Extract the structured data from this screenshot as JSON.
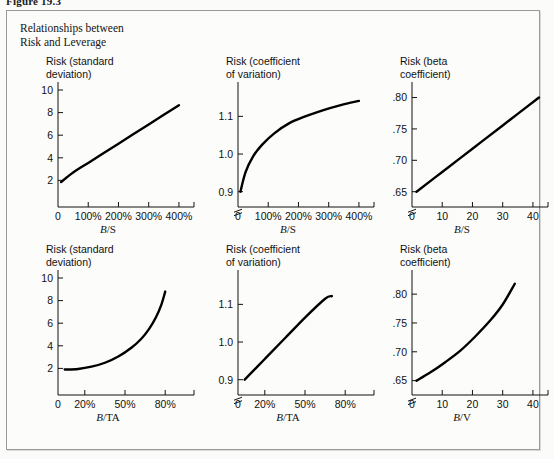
{
  "figure": {
    "number": "Figure 19.3",
    "caption_line1": "Relationships between",
    "caption_line2": "Risk and Leverage"
  },
  "chart_data": [
    {
      "id": "panel-1",
      "type": "line",
      "title": "Risk (standard\ndeviation)",
      "xlabel_num": "B",
      "xlabel_den": "/S",
      "xlabel": "B/S",
      "ylabel": "",
      "xticks": [
        "0",
        "100%",
        "200%",
        "300%",
        "400%"
      ],
      "xtick_values": [
        0,
        100,
        200,
        300,
        400
      ],
      "yticks": [
        "2",
        "4",
        "6",
        "8",
        "10"
      ],
      "ytick_values": [
        2,
        4,
        6,
        8,
        10
      ],
      "xlim": [
        0,
        430
      ],
      "ylim": [
        0,
        10
      ],
      "axis_break_y": false,
      "grid": false,
      "legend": "none",
      "x": [
        10,
        50,
        100,
        150,
        200,
        250,
        300,
        350,
        400
      ],
      "values": [
        1.85,
        2.7,
        3.55,
        4.4,
        5.25,
        6.1,
        6.95,
        7.8,
        8.65
      ]
    },
    {
      "id": "panel-2",
      "type": "line",
      "title": "Risk (coefficient\nof variation)",
      "xlabel_num": "B",
      "xlabel_den": "/S",
      "xlabel": "B/S",
      "ylabel": "",
      "xticks": [
        "0",
        "100%",
        "200%",
        "300%",
        "400%"
      ],
      "xtick_values": [
        0,
        100,
        200,
        300,
        400
      ],
      "yticks": [
        "0.9",
        "1.0",
        "1.1"
      ],
      "ytick_values": [
        0.9,
        1.0,
        1.1
      ],
      "xlim": [
        0,
        430
      ],
      "ylim": [
        0.87,
        1.17
      ],
      "axis_break_y": true,
      "grid": false,
      "legend": "none",
      "x": [
        8,
        25,
        50,
        80,
        120,
        170,
        220,
        280,
        340,
        400
      ],
      "values": [
        0.9,
        0.952,
        0.994,
        1.025,
        1.055,
        1.082,
        1.099,
        1.116,
        1.13,
        1.141
      ]
    },
    {
      "id": "panel-3",
      "type": "line",
      "title": "Risk (beta\ncoefficient)",
      "xlabel_num": "B",
      "xlabel_den": "/S",
      "xlabel": "B/S",
      "ylabel": "",
      "xticks": [
        "0",
        "10",
        "20",
        "30",
        "40"
      ],
      "xtick_values": [
        0,
        10,
        20,
        30,
        40
      ],
      "yticks": [
        ".65",
        ".70",
        ".75",
        ".80"
      ],
      "ytick_values": [
        0.65,
        0.7,
        0.75,
        0.8
      ],
      "xlim": [
        0,
        43
      ],
      "ylim": [
        0.632,
        0.812
      ],
      "axis_break_y": true,
      "grid": false,
      "legend": "none",
      "x": [
        1.5,
        10,
        20,
        30,
        42
      ],
      "values": [
        0.65,
        0.6815,
        0.7185,
        0.7555,
        0.8
      ]
    },
    {
      "id": "panel-4",
      "type": "line",
      "title": "Risk (standard\ndeviation)",
      "xlabel_num": "B",
      "xlabel_den": "/TA",
      "xlabel": "B/TA",
      "ylabel": "",
      "xticks": [
        "0",
        "20%",
        "50%",
        "80%"
      ],
      "xtick_values": [
        0,
        20,
        50,
        80
      ],
      "yticks": [
        "2",
        "4",
        "6",
        "8",
        "10"
      ],
      "ytick_values": [
        2,
        4,
        6,
        8,
        10
      ],
      "xlim": [
        0,
        97
      ],
      "ylim": [
        0,
        10
      ],
      "axis_break_y": false,
      "grid": false,
      "legend": "none",
      "x": [
        5,
        15,
        25,
        35,
        45,
        55,
        62,
        68,
        73,
        77,
        80
      ],
      "values": [
        1.9,
        1.95,
        2.15,
        2.5,
        3.05,
        3.85,
        4.6,
        5.5,
        6.5,
        7.6,
        8.8
      ]
    },
    {
      "id": "panel-5",
      "type": "line",
      "title": "Risk (coefficient\nof variation)",
      "xlabel_num": "B",
      "xlabel_den": "/TA",
      "xlabel": "B/TA",
      "ylabel": "",
      "xticks": [
        "0",
        "20%",
        "50%",
        "80%"
      ],
      "xtick_values": [
        0,
        20,
        50,
        80
      ],
      "yticks": [
        "0.9",
        "1.0",
        "1.1"
      ],
      "ytick_values": [
        0.9,
        1.0,
        1.1
      ],
      "xlim": [
        0,
        97
      ],
      "ylim": [
        0.87,
        1.17
      ],
      "axis_break_y": true,
      "grid": false,
      "legend": "none",
      "x": [
        5,
        20,
        35,
        50,
        65,
        70
      ],
      "values": [
        0.9,
        0.955,
        1.01,
        1.065,
        1.115,
        1.122
      ]
    },
    {
      "id": "panel-6",
      "type": "line",
      "title": "Risk (beta\ncoefficient)",
      "xlabel_num": "B",
      "xlabel_den": "/V",
      "xlabel": "B/V",
      "ylabel": "",
      "xticks": [
        "0",
        "10",
        "20",
        "30",
        "40"
      ],
      "xtick_values": [
        0,
        10,
        20,
        30,
        40
      ],
      "yticks": [
        ".65",
        ".70",
        ".75",
        ".80"
      ],
      "ytick_values": [
        0.65,
        0.7,
        0.75,
        0.8
      ],
      "xlim": [
        0,
        43
      ],
      "ylim": [
        0.632,
        0.828
      ],
      "axis_break_y": true,
      "grid": false,
      "legend": "none",
      "x": [
        1.5,
        6,
        11,
        16,
        21,
        26,
        30,
        34
      ],
      "values": [
        0.65,
        0.664,
        0.682,
        0.702,
        0.727,
        0.755,
        0.782,
        0.818
      ]
    }
  ]
}
